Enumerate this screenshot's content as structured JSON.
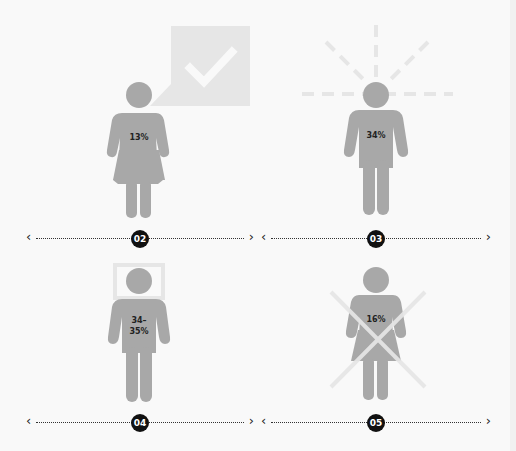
{
  "colors": {
    "background": "#f9f9f9",
    "figure": "#a8a8a8",
    "accent_light": "#e6e6e6",
    "badge": "#111111",
    "text": "#222222"
  },
  "figures": [
    {
      "id": "02",
      "gender": "female",
      "symbol": "check-speech-bubble",
      "percent_label": "13%"
    },
    {
      "id": "03",
      "gender": "male",
      "symbol": "radiating-dashes",
      "percent_label": "34%"
    },
    {
      "id": "04",
      "gender": "male",
      "symbol": "head-frame",
      "percent_label_line1": "34–",
      "percent_label_line2": "35%"
    },
    {
      "id": "05",
      "gender": "female",
      "symbol": "cross-out",
      "percent_label": "16%"
    }
  ],
  "scales": [
    {
      "badge": "02",
      "left_arrow": "‹",
      "right_arrow": "›"
    },
    {
      "badge": "03",
      "left_arrow": "‹",
      "right_arrow": "›"
    },
    {
      "badge": "04",
      "left_arrow": "‹",
      "right_arrow": "›"
    },
    {
      "badge": "05",
      "left_arrow": "‹",
      "right_arrow": "›"
    }
  ]
}
